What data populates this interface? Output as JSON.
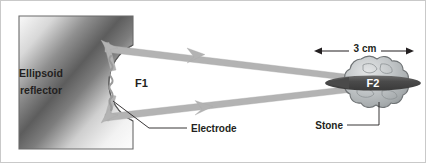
{
  "figure": {
    "background_color": "#ffffff",
    "border_color": "#c9c9c9",
    "width": 426,
    "height": 163
  },
  "labels": {
    "reflector_line1": "Ellipsoid",
    "reflector_line2": "reflector",
    "focus1": "F1",
    "focus2": "F2",
    "electrode": "Electrode",
    "stone": "Stone",
    "dimension": "3 cm"
  },
  "colors": {
    "ray": "#b3b3b3",
    "ray_outline": "#9a9a9a",
    "reflector_dark": "#4a4a4a",
    "reflector_light": "#f2f2f2",
    "reflector_outline": "#6b6b6b",
    "stone_fill": "#b8bcbd",
    "stone_outline": "#6f7375",
    "focus_band": "#4d4d4d",
    "text": "#231f20",
    "leader": "#231f20"
  },
  "geometry": {
    "reflector_left": 18,
    "reflector_right": 132,
    "reflector_top": 15,
    "reflector_bottom": 148,
    "focus1_x": 113,
    "focus1_y": 82,
    "focus2_x": 360,
    "focus2_y": 82,
    "dimension_left_x": 313,
    "dimension_right_x": 413,
    "dimension_y": 50
  },
  "elements": {
    "ray_count": 4,
    "arrowheads": 6,
    "dimension_arrow_heads": 2
  }
}
